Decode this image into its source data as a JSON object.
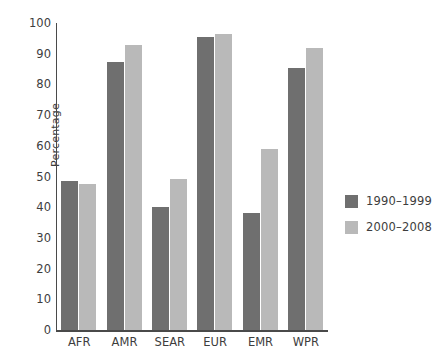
{
  "chart_data": {
    "type": "bar",
    "title": "",
    "xlabel": "",
    "ylabel": "Percentage",
    "ylim": [
      0,
      100
    ],
    "ytick_step": 10,
    "yticks": [
      "100",
      "90",
      "80",
      "70",
      "60",
      "50",
      "40",
      "30",
      "20",
      "10",
      "0"
    ],
    "grid": false,
    "legend_position": "right",
    "categories": [
      "AFR",
      "AMR",
      "SEAR",
      "EUR",
      "EMR",
      "WPR"
    ],
    "series": [
      {
        "name": "1990–1999",
        "color": "#6f6f6f",
        "values": [
          48.5,
          87.3,
          40.0,
          95.5,
          38.0,
          85.2
        ]
      },
      {
        "name": "2000–2008",
        "color": "#b9b9b9",
        "values": [
          47.5,
          92.7,
          49.3,
          96.3,
          59.0,
          92.0
        ]
      }
    ]
  },
  "legend": {
    "items": [
      {
        "label": "1990–1999",
        "color": "#6f6f6f"
      },
      {
        "label": "2000–2008",
        "color": "#b9b9b9"
      }
    ]
  },
  "axes": {
    "y_title": "Percentage"
  }
}
